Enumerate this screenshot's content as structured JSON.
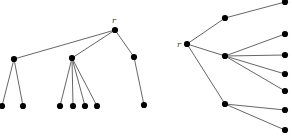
{
  "figure": {
    "node_color": "#000000",
    "edge_color": "#555555"
  },
  "left_tree": {
    "root_label": "r",
    "nodes": [
      {
        "id": "r",
        "x": 115,
        "y": 30
      },
      {
        "id": "a",
        "x": 14,
        "y": 59
      },
      {
        "id": "b",
        "x": 72,
        "y": 58
      },
      {
        "id": "c",
        "x": 134,
        "y": 57
      },
      {
        "id": "a1",
        "x": 2,
        "y": 106
      },
      {
        "id": "a2",
        "x": 23,
        "y": 106
      },
      {
        "id": "b1",
        "x": 60,
        "y": 106
      },
      {
        "id": "b2",
        "x": 73,
        "y": 106
      },
      {
        "id": "b3",
        "x": 85,
        "y": 106
      },
      {
        "id": "b4",
        "x": 97,
        "y": 106
      },
      {
        "id": "c1",
        "x": 144,
        "y": 105
      }
    ],
    "edges": [
      [
        "r",
        "a"
      ],
      [
        "r",
        "b"
      ],
      [
        "r",
        "c"
      ],
      [
        "a",
        "a1"
      ],
      [
        "a",
        "a2"
      ],
      [
        "b",
        "b1"
      ],
      [
        "b",
        "b2"
      ],
      [
        "b",
        "b3"
      ],
      [
        "b",
        "b4"
      ],
      [
        "c",
        "c1"
      ]
    ]
  },
  "right_tree": {
    "root_label": "r",
    "nodes": [
      {
        "id": "r",
        "x": 187,
        "y": 44
      },
      {
        "id": "a",
        "x": 225,
        "y": 18
      },
      {
        "id": "b",
        "x": 225,
        "y": 56
      },
      {
        "id": "c",
        "x": 225,
        "y": 104
      },
      {
        "id": "a1",
        "x": 285,
        "y": 2
      },
      {
        "id": "b1",
        "x": 285,
        "y": 34
      },
      {
        "id": "b2",
        "x": 285,
        "y": 55
      },
      {
        "id": "b3",
        "x": 285,
        "y": 74
      },
      {
        "id": "b4",
        "x": 285,
        "y": 91
      },
      {
        "id": "c1",
        "x": 285,
        "y": 110
      },
      {
        "id": "c2",
        "x": 285,
        "y": 130
      }
    ],
    "edges": [
      [
        "r",
        "a"
      ],
      [
        "r",
        "b"
      ],
      [
        "r",
        "c"
      ],
      [
        "a",
        "a1"
      ],
      [
        "b",
        "b1"
      ],
      [
        "b",
        "b2"
      ],
      [
        "b",
        "b3"
      ],
      [
        "b",
        "b4"
      ],
      [
        "c",
        "c1"
      ],
      [
        "c",
        "c2"
      ]
    ]
  }
}
